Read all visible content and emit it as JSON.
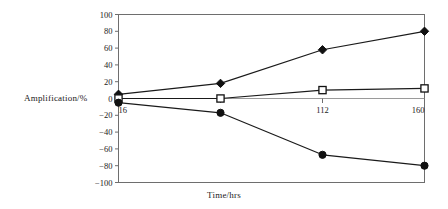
{
  "chart_data": {
    "type": "line",
    "title": "",
    "xlabel": "Time/hrs",
    "ylabel": "Amplification/%",
    "x": [
      16,
      64,
      112,
      160
    ],
    "x_tick_labels": [
      "16",
      "",
      "112",
      "160"
    ],
    "y_tick_labels": [
      "100",
      "80",
      "60",
      "40",
      "20",
      "0",
      "-20",
      "-40",
      "-60",
      "-80",
      "-100"
    ],
    "y_ticks": [
      100,
      80,
      60,
      40,
      20,
      0,
      -20,
      -40,
      -60,
      -80,
      -100
    ],
    "ylim": [
      -100,
      100
    ],
    "xlim": [
      16,
      160
    ],
    "grid": false,
    "legend": "none",
    "line_color": "#1a1a1a",
    "frame_color": "#6e6e6e",
    "series": [
      {
        "name": "upper-series",
        "marker": "filled-diamond",
        "values": [
          5,
          18,
          58,
          80
        ]
      },
      {
        "name": "middle-series",
        "marker": "open-square",
        "values": [
          0,
          0,
          10,
          12
        ]
      },
      {
        "name": "lower-series",
        "marker": "filled-circle",
        "values": [
          -5,
          -17,
          -67,
          -80
        ]
      }
    ]
  }
}
